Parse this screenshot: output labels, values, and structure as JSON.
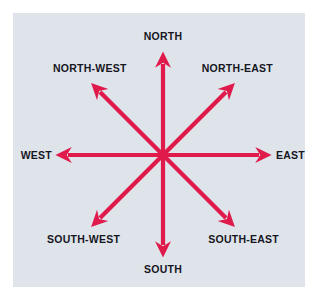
{
  "figure": {
    "panel_color": "#dfe3ea",
    "background_color": "#ffffff",
    "arrow_color": "#e01b4c",
    "label_color": "#16161e"
  },
  "compass": {
    "center": {
      "x": 163,
      "y": 155
    },
    "directions": [
      {
        "key": "north",
        "label": "NORTH",
        "bearing_deg": 0,
        "tip": {
          "x": 163,
          "y": 58
        }
      },
      {
        "key": "north-east",
        "label": "NORTH-EAST",
        "bearing_deg": 45,
        "tip": {
          "x": 231,
          "y": 87
        }
      },
      {
        "key": "east",
        "label": "EAST",
        "bearing_deg": 90,
        "tip": {
          "x": 266,
          "y": 155
        }
      },
      {
        "key": "south-east",
        "label": "SOUTH-EAST",
        "bearing_deg": 135,
        "tip": {
          "x": 231,
          "y": 223
        }
      },
      {
        "key": "south",
        "label": "SOUTH",
        "bearing_deg": 180,
        "tip": {
          "x": 163,
          "y": 251
        }
      },
      {
        "key": "south-west",
        "label": "SOUTH-WEST",
        "bearing_deg": 225,
        "tip": {
          "x": 95,
          "y": 223
        }
      },
      {
        "key": "west",
        "label": "WEST",
        "bearing_deg": 270,
        "tip": {
          "x": 61,
          "y": 155
        }
      },
      {
        "key": "north-west",
        "label": "NORTH-WEST",
        "bearing_deg": 315,
        "tip": {
          "x": 95,
          "y": 87
        }
      }
    ]
  }
}
